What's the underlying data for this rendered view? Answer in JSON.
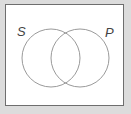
{
  "diagram": {
    "type": "venn",
    "sets": [
      {
        "label": "S",
        "cx": 51,
        "cy": 58,
        "r": 29
      },
      {
        "label": "P",
        "cx": 80,
        "cy": 58,
        "r": 29
      }
    ],
    "colors": {
      "circle_stroke": "#9a9a9a",
      "frame": "#6e6e6e",
      "background": "#dcdcdc"
    }
  }
}
